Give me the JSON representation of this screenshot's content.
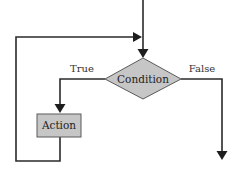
{
  "diagram": {
    "type": "flowchart",
    "nodes": [
      {
        "id": "condition",
        "shape": "diamond",
        "label": "Condition"
      },
      {
        "id": "action",
        "shape": "rectangle",
        "label": "Action"
      }
    ],
    "edges": [
      {
        "id": "entry",
        "from": "start",
        "to": "condition",
        "label": ""
      },
      {
        "id": "true-branch",
        "from": "condition",
        "to": "action",
        "label": "True"
      },
      {
        "id": "false-branch",
        "from": "condition",
        "to": "exit",
        "label": "False"
      },
      {
        "id": "loop-back",
        "from": "action",
        "to": "condition",
        "label": ""
      }
    ],
    "colors": {
      "shape_fill": "#c6c6c6",
      "line": "#2a2a2a",
      "text": "#222222"
    }
  }
}
